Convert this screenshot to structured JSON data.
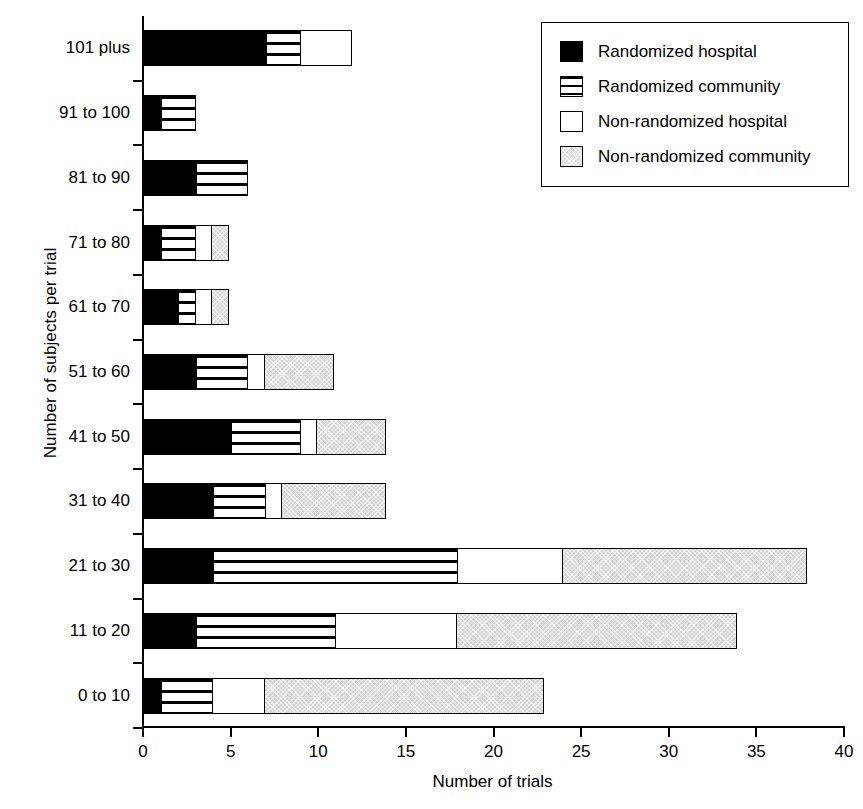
{
  "chart_data": {
    "type": "bar",
    "orientation": "horizontal",
    "stacked": true,
    "title": "",
    "xlabel": "Number of trials",
    "ylabel": "Number of subjects per trial",
    "xlim": [
      0,
      40
    ],
    "xticks": [
      0,
      5,
      10,
      15,
      20,
      25,
      30,
      35,
      40
    ],
    "grid": false,
    "legend_position": "top-right",
    "categories": [
      "101 plus",
      "91 to 100",
      "81 to 90",
      "71 to 80",
      "61 to 70",
      "51 to 60",
      "41 to 50",
      "31 to 40",
      "21 to 30",
      "11 to 20",
      "0 to 10"
    ],
    "series": [
      {
        "name": "Randomized hospital",
        "swatch": "solid-black",
        "color": "#000000",
        "values": [
          7,
          1,
          3,
          1,
          2,
          3,
          5,
          4,
          4,
          3,
          1
        ]
      },
      {
        "name": "Randomized community",
        "swatch": "horizontal-stripes",
        "color": "#ffffff",
        "values": [
          2,
          2,
          3,
          2,
          1,
          3,
          4,
          3,
          14,
          8,
          3
        ]
      },
      {
        "name": "Non-randomized hospital",
        "swatch": "white",
        "color": "#ffffff",
        "values": [
          3,
          0,
          0,
          1,
          1,
          1,
          1,
          1,
          6,
          7,
          3
        ]
      },
      {
        "name": "Non-randomized community",
        "swatch": "light-grey",
        "color": "#d4d4d4",
        "values": [
          0,
          0,
          0,
          1,
          1,
          4,
          4,
          6,
          14,
          16,
          16
        ]
      }
    ],
    "totals": [
      12,
      3,
      6,
      5,
      5,
      11,
      14,
      14,
      38,
      34,
      23
    ]
  }
}
